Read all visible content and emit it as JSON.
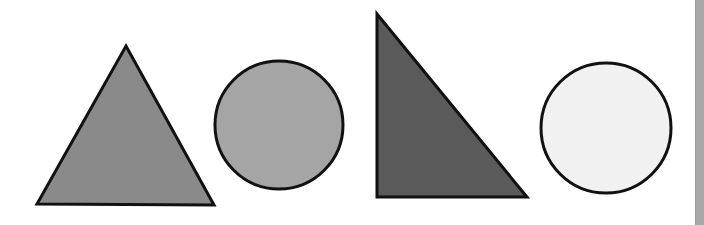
{
  "shapes": [
    {
      "id": "shape-1",
      "type": "isosceles-triangle",
      "points": [
        [
          126,
          46
        ],
        [
          214,
          205
        ],
        [
          37,
          204
        ]
      ],
      "fill": "#8a8a8a",
      "stroke": "#111111",
      "stroke_width": 3
    },
    {
      "id": "shape-2",
      "type": "circle",
      "cx": 279,
      "cy": 125,
      "r": 64,
      "fill": "#a5a5a5",
      "stroke": "#111111",
      "stroke_width": 3
    },
    {
      "id": "shape-3",
      "type": "right-triangle",
      "points": [
        [
          377,
          14
        ],
        [
          527,
          197
        ],
        [
          377,
          197
        ]
      ],
      "fill": "#5a5a5a",
      "stroke": "#111111",
      "stroke_width": 3
    },
    {
      "id": "shape-4",
      "type": "circle",
      "cx": 606,
      "cy": 128,
      "r": 65,
      "fill": "#f1f1f1",
      "stroke": "#111111",
      "stroke_width": 3
    }
  ],
  "edge_bar": {
    "color": "#a8a8a8"
  }
}
